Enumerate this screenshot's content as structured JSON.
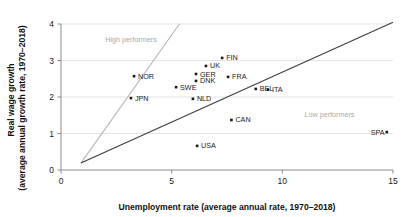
{
  "chart_data": {
    "type": "scatter",
    "title": "",
    "xlabel": "Unemployment rate (average annual rate, 1970–2018)",
    "ylabel_line1": "Real wage growth",
    "ylabel_line2": "(average annual growth rate, 1970–2018)",
    "xlim": [
      0,
      15
    ],
    "ylim": [
      0,
      4
    ],
    "xticks": [
      0,
      5,
      10,
      15
    ],
    "xtick_labels": [
      "0",
      "5",
      "10",
      "15"
    ],
    "yticks": [
      0,
      1,
      2,
      3,
      4
    ],
    "ytick_labels": [
      "0",
      "1",
      "2",
      "3",
      "4"
    ],
    "grid": "horizontal",
    "legend": "none",
    "annotations": [
      {
        "text": "High performers",
        "x": 2.0,
        "y": 3.52,
        "color": "#a9a9a9"
      },
      {
        "text": "Low performers",
        "x": 11.0,
        "y": 1.45,
        "color": "#a9a9a9"
      }
    ],
    "reference_lines": [
      {
        "name": "upper-frontier",
        "color": "#b5b5b5",
        "x": [
          0.9,
          5.35
        ],
        "y": [
          0.19,
          4.0
        ]
      },
      {
        "name": "lower-frontier",
        "color": "#3d3d3d",
        "x": [
          0.9,
          15.0
        ],
        "y": [
          0.19,
          4.05
        ]
      }
    ],
    "points": [
      {
        "label": "NOR",
        "x": 3.3,
        "y": 2.57,
        "label_dx": 4,
        "label_dy": 2.5
      },
      {
        "label": "JPN",
        "x": 3.16,
        "y": 1.97,
        "label_dx": 4,
        "label_dy": 2.5
      },
      {
        "label": "SWE",
        "x": 5.2,
        "y": 2.27,
        "label_dx": 4,
        "label_dy": 2.5
      },
      {
        "label": "NLD",
        "x": 5.96,
        "y": 1.95,
        "label_dx": 4,
        "label_dy": 2.5
      },
      {
        "label": "GER",
        "x": 6.1,
        "y": 2.63,
        "label_dx": 4,
        "label_dy": 2.5
      },
      {
        "label": "DNK",
        "x": 6.1,
        "y": 2.44,
        "label_dx": 4,
        "label_dy": 2.5
      },
      {
        "label": "USA",
        "x": 6.15,
        "y": 0.66,
        "label_dx": 4,
        "label_dy": 2.5
      },
      {
        "label": "UK",
        "x": 6.55,
        "y": 2.85,
        "label_dx": 4,
        "label_dy": 2.5
      },
      {
        "label": "FIN",
        "x": 7.28,
        "y": 3.07,
        "label_dx": 4,
        "label_dy": 2.5
      },
      {
        "label": "FRA",
        "x": 7.55,
        "y": 2.55,
        "label_dx": 4,
        "label_dy": 2.5
      },
      {
        "label": "CAN",
        "x": 7.7,
        "y": 1.37,
        "label_dx": 4,
        "label_dy": 2.5
      },
      {
        "label": "BEL",
        "x": 8.8,
        "y": 2.22,
        "label_dx": 4,
        "label_dy": 2.5
      },
      {
        "label": "ITA",
        "x": 9.35,
        "y": 2.2,
        "label_dx": 4,
        "label_dy": 2.5
      },
      {
        "label": "SPA",
        "x": 14.72,
        "y": 1.04,
        "label_dx": -16,
        "label_dy": 2.5
      }
    ]
  }
}
